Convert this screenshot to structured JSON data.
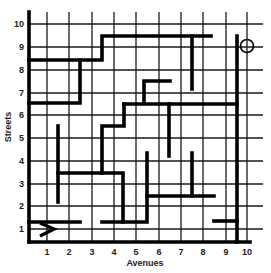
{
  "diagram": {
    "type": "street-grid-maze",
    "x_axis": {
      "title": "Avenues",
      "ticks": [
        "1",
        "2",
        "3",
        "4",
        "5",
        "6",
        "7",
        "8",
        "9",
        "10"
      ]
    },
    "y_axis": {
      "title": "Streets",
      "ticks": [
        "1",
        "2",
        "3",
        "4",
        "5",
        "6",
        "7",
        "8",
        "9",
        "10"
      ]
    },
    "start": {
      "marker": "arrow-right-icon",
      "avenue": 1,
      "street": 1,
      "glyph": ">"
    },
    "goal": {
      "marker": "circle-target-icon",
      "avenue": 10,
      "street": 9.5
    },
    "colors": {
      "line": "#000000",
      "grid": "#1a1a1a",
      "background": "#ffffff",
      "text": "#222222"
    }
  },
  "geometry": {
    "left": 29,
    "bottom": 242,
    "top": 12,
    "right": 263,
    "avenue_x": [
      47,
      69,
      92,
      114,
      136,
      159,
      181,
      203,
      226,
      247
    ],
    "street_y": [
      229,
      206,
      184,
      161,
      138,
      115,
      93,
      70,
      47,
      24
    ]
  },
  "walls": [
    {
      "name": "border-left",
      "points": [
        [
          29,
          12
        ],
        [
          29,
          242
        ]
      ]
    },
    {
      "name": "border-bottom",
      "points": [
        [
          29,
          242
        ],
        [
          250,
          242
        ]
      ]
    },
    {
      "name": "wall-top-staircase",
      "points": [
        [
          29,
          60
        ],
        [
          102,
          60
        ],
        [
          102,
          36
        ],
        [
          211,
          36
        ]
      ]
    },
    {
      "name": "wall-top-drop",
      "points": [
        [
          192,
          36
        ],
        [
          192,
          89
        ]
      ]
    },
    {
      "name": "wall-right-long",
      "points": [
        [
          237,
          36
        ],
        [
          237,
          242
        ]
      ]
    },
    {
      "name": "wall-upper-left-box",
      "points": [
        [
          80,
          60
        ],
        [
          80,
          103
        ],
        [
          29,
          103
        ]
      ]
    },
    {
      "name": "wall-small-hook",
      "points": [
        [
          144,
          102
        ],
        [
          144,
          81
        ],
        [
          170,
          81
        ]
      ]
    },
    {
      "name": "wall-mid-horizontal",
      "points": [
        [
          124,
          104
        ],
        [
          237,
          104
        ]
      ]
    },
    {
      "name": "wall-staircase-middle",
      "points": [
        [
          124,
          104
        ],
        [
          124,
          126
        ],
        [
          102,
          126
        ],
        [
          102,
          173
        ]
      ]
    },
    {
      "name": "wall-mid-drop-a",
      "points": [
        [
          169,
          104
        ],
        [
          169,
          156
        ]
      ]
    },
    {
      "name": "wall-left-stub",
      "points": [
        [
          58,
          126
        ],
        [
          58,
          202
        ]
      ]
    },
    {
      "name": "wall-lower-shelf",
      "points": [
        [
          58,
          173
        ],
        [
          123,
          173
        ],
        [
          123,
          222
        ]
      ]
    },
    {
      "name": "wall-bottom-left",
      "points": [
        [
          29,
          222
        ],
        [
          80,
          222
        ]
      ]
    },
    {
      "name": "wall-bottom-mid",
      "points": [
        [
          102,
          222
        ],
        [
          147,
          222
        ],
        [
          147,
          153
        ]
      ]
    },
    {
      "name": "wall-lower-right-shelf",
      "points": [
        [
          147,
          196
        ],
        [
          214,
          196
        ]
      ]
    },
    {
      "name": "wall-lower-right-drop",
      "points": [
        [
          192,
          153
        ],
        [
          192,
          196
        ]
      ]
    },
    {
      "name": "wall-bottom-right-stub",
      "points": [
        [
          214,
          221
        ],
        [
          237,
          221
        ]
      ]
    }
  ]
}
